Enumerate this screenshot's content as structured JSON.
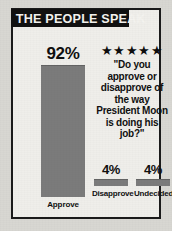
{
  "banner": {
    "title": "THE PEOPLE SPEAK"
  },
  "poll": {
    "stars": "★★★★★",
    "question": "\"Do you approve or disapprove of the way President Moon is doing his job?\""
  },
  "chart_data": {
    "type": "bar",
    "title": "THE PEOPLE SPEAK",
    "categories": [
      "Approve",
      "Disapprove",
      "Undecided"
    ],
    "values": [
      92,
      4,
      4
    ],
    "value_labels": [
      "92%",
      "4%",
      "4%"
    ],
    "xlabel": "",
    "ylabel": "",
    "ylim": [
      0,
      100
    ],
    "grid": false,
    "legend": false,
    "bar_color": "#7b7b7b",
    "annotations": [
      "\"Do you approve or disapprove of the way President Moon is doing his job?\"",
      "★★★★★"
    ]
  },
  "colors": {
    "banner_bg": "#111111",
    "banner_text": "#f4f3ef",
    "frame_border": "#1a1a1a",
    "paper": "#efeeea",
    "bar": "#7b7b7b",
    "text": "#0f0f0f"
  }
}
